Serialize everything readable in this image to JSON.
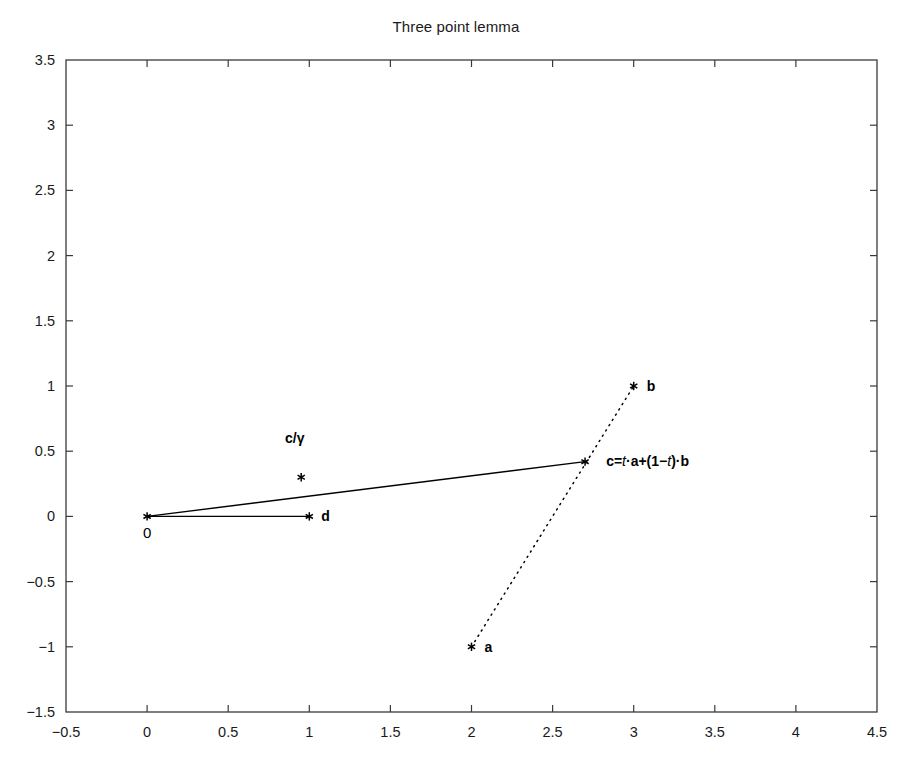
{
  "chart_data": {
    "type": "scatter",
    "title": "Three point lemma",
    "xlabel": "",
    "ylabel": "",
    "xlim": [
      -0.5,
      4.5
    ],
    "ylim": [
      -1.5,
      3.5
    ],
    "grid": false,
    "legend": "none",
    "xticks": [
      "-0.5",
      "0",
      "0.5",
      "1",
      "1.5",
      "2",
      "2.5",
      "3",
      "3.5",
      "4",
      "4.5"
    ],
    "xtick_values": [
      -0.5,
      0,
      0.5,
      1,
      1.5,
      2,
      2.5,
      3,
      3.5,
      4,
      4.5
    ],
    "yticks": [
      "-1.5",
      "-1",
      "-0.5",
      "0",
      "0.5",
      "1",
      "1.5",
      "2",
      "2.5",
      "3",
      "3.5"
    ],
    "ytick_values": [
      -1.5,
      -1,
      -0.5,
      0,
      0.5,
      1,
      1.5,
      2,
      2.5,
      3,
      3.5
    ],
    "points": [
      {
        "name": "origin",
        "x": 0,
        "y": 0,
        "label": "0",
        "label_dx": -4,
        "label_dy": 22,
        "bold": false,
        "marker": "*"
      },
      {
        "name": "d",
        "x": 1,
        "y": 0,
        "label": "d",
        "label_dx": 12,
        "label_dy": 5,
        "bold": true,
        "marker": "*"
      },
      {
        "name": "c-over-gamma",
        "x": 0.95,
        "y": 0.3,
        "label": "",
        "label_dx": 0,
        "label_dy": 0,
        "bold": true,
        "marker": "*"
      },
      {
        "name": "c",
        "x": 2.7,
        "y": 0.42,
        "label": "",
        "label_dx": 0,
        "label_dy": 0,
        "bold": true,
        "marker": "*"
      },
      {
        "name": "b",
        "x": 3,
        "y": 1,
        "label": "b",
        "label_dx": 13,
        "label_dy": 5,
        "bold": true,
        "marker": "*"
      },
      {
        "name": "a",
        "x": 2,
        "y": -1,
        "label": "a",
        "label_dx": 13,
        "label_dy": 5,
        "bold": true,
        "marker": "*"
      }
    ],
    "segments": [
      {
        "name": "origin-to-c",
        "x1": 0,
        "y1": 0,
        "x2": 2.7,
        "y2": 0.42,
        "style": "solid"
      },
      {
        "name": "origin-to-d",
        "x1": 0,
        "y1": 0,
        "x2": 1,
        "y2": 0,
        "style": "solid"
      },
      {
        "name": "a-to-b",
        "x1": 2,
        "y1": -1,
        "x2": 3,
        "y2": 1,
        "style": "dotted"
      }
    ],
    "annotations": [
      {
        "name": "c-over-gamma-label",
        "text": "c/γ",
        "x": 0.85,
        "y": 0.56
      },
      {
        "name": "c-equation-label",
        "text": "c=t·a+(1−t)·b",
        "x": 2.83,
        "y": 0.39
      }
    ]
  }
}
